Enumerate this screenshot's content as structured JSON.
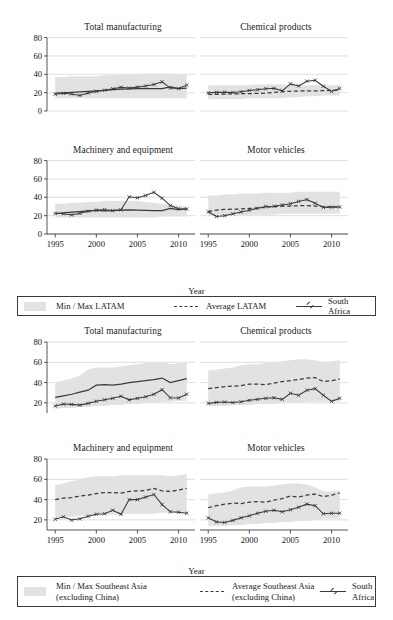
{
  "figures": [
    {
      "id": "latam",
      "axis_label_x": "Year",
      "legend": {
        "band_label": "Min / Max LATAM",
        "avg_label": "Average LATAM",
        "sa_label": "South Africa"
      },
      "panels": [
        {
          "title": "Total manufacturing"
        },
        {
          "title": "Chemical products"
        },
        {
          "title": "Machinery and equipment"
        },
        {
          "title": "Motor vehicles"
        }
      ]
    },
    {
      "id": "seasia",
      "axis_label_x": "Year",
      "legend": {
        "band_label": "Min / Max Southeast Asia\n(excluding China)",
        "avg_label": "Average Southeast Asia\n(excluding China)",
        "sa_label": "South Africa"
      },
      "panels": [
        {
          "title": "Total manufacturing"
        },
        {
          "title": "Chemical products"
        },
        {
          "title": "Machinery and equipment"
        },
        {
          "title": "Motor vehicles"
        }
      ]
    }
  ],
  "chart_data": [
    {
      "type": "line",
      "title": "Total manufacturing",
      "figure": "LATAM",
      "xlabel": "Year",
      "ylabel": "",
      "xlim": [
        1994,
        2012
      ],
      "ylim": [
        0,
        85
      ],
      "yticks": [
        0,
        20,
        40,
        60,
        80
      ],
      "xticks": [
        1995,
        2000,
        2005,
        2010
      ],
      "grid": true,
      "legend_position": "below-figure",
      "x": [
        1995,
        1996,
        1997,
        1998,
        1999,
        2000,
        2001,
        2002,
        2003,
        2004,
        2005,
        2006,
        2007,
        2008,
        2009,
        2010,
        2011
      ],
      "band_min": [
        14,
        14,
        14,
        14,
        14,
        14,
        14,
        14,
        14,
        14,
        14,
        14,
        14,
        14,
        14,
        14,
        14
      ],
      "band_max": [
        37,
        37,
        38,
        38,
        38,
        38,
        39,
        39,
        40,
        40,
        40,
        41,
        41,
        41,
        41,
        40,
        40
      ],
      "series": [
        {
          "name": "Average LATAM",
          "style": "solid",
          "values": [
            19.5,
            19.8,
            20.2,
            20.8,
            21.4,
            22.0,
            22.6,
            23.2,
            23.8,
            24.2,
            24.3,
            24.3,
            24.4,
            24.5,
            26.3,
            24.5,
            24.8
          ]
        },
        {
          "name": "South Africa",
          "style": "marker-line",
          "values": [
            18.3,
            19.3,
            18.6,
            17.0,
            19.6,
            21.3,
            22.6,
            24.2,
            25.8,
            25.0,
            26.0,
            27.2,
            28.9,
            31.8,
            25.0,
            24.5,
            28.2
          ]
        }
      ]
    },
    {
      "type": "line",
      "title": "Chemical products",
      "figure": "LATAM",
      "xlabel": "Year",
      "ylabel": "",
      "xlim": [
        1994,
        2012
      ],
      "ylim": [
        0,
        85
      ],
      "yticks": [
        0,
        20,
        40,
        60,
        80
      ],
      "xticks": [
        1995,
        2000,
        2005,
        2010
      ],
      "grid": true,
      "x": [
        1995,
        1996,
        1997,
        1998,
        1999,
        2000,
        2001,
        2002,
        2003,
        2004,
        2005,
        2006,
        2007,
        2008,
        2009,
        2010,
        2011
      ],
      "band_min": [
        13,
        13,
        13,
        13,
        13,
        14,
        14,
        14,
        14,
        14,
        15,
        15,
        16,
        16,
        17,
        17,
        17
      ],
      "band_max": [
        28,
        28,
        28,
        28,
        28,
        28,
        29,
        29,
        29,
        29,
        28,
        28,
        28,
        28,
        28,
        28,
        28
      ],
      "series": [
        {
          "name": "Average LATAM",
          "style": "dashed",
          "values": [
            18.0,
            18.2,
            18.5,
            18.6,
            18.8,
            19.0,
            19.2,
            19.5,
            20.3,
            21.0,
            21.5,
            21.8,
            22.0,
            22.0,
            22.2,
            22.4,
            23.0
          ]
        },
        {
          "name": "South Africa",
          "style": "marker-line",
          "values": [
            19.8,
            20.3,
            20.5,
            20.2,
            21.0,
            22.4,
            23.2,
            24.3,
            24.7,
            22.0,
            29.5,
            27.3,
            32.5,
            33.5,
            27.0,
            21.3,
            24.5
          ]
        }
      ]
    },
    {
      "type": "line",
      "title": "Machinery and equipment",
      "figure": "LATAM",
      "xlabel": "Year",
      "ylabel": "",
      "xlim": [
        1994,
        2012
      ],
      "ylim": [
        0,
        85
      ],
      "yticks": [
        0,
        20,
        40,
        60,
        80
      ],
      "xticks": [
        1995,
        2000,
        2005,
        2010
      ],
      "grid": true,
      "x": [
        1995,
        1996,
        1997,
        1998,
        1999,
        2000,
        2001,
        2002,
        2003,
        2004,
        2005,
        2006,
        2007,
        2008,
        2009,
        2010,
        2011
      ],
      "band_min": [
        18,
        18,
        18,
        18,
        18,
        18,
        18,
        18,
        18,
        18,
        18,
        18,
        18,
        19,
        19,
        19,
        19
      ],
      "band_max": [
        33,
        33,
        34,
        34,
        35,
        35,
        36,
        36,
        36,
        36,
        36,
        35,
        34,
        33,
        32,
        31,
        30
      ],
      "series": [
        {
          "name": "Average LATAM",
          "style": "solid",
          "values": [
            22.3,
            23.0,
            23.8,
            24.5,
            25.2,
            25.8,
            25.3,
            25.5,
            26.0,
            26.2,
            26.0,
            25.8,
            25.6,
            25.5,
            27.8,
            26.5,
            27.3
          ]
        },
        {
          "name": "South Africa",
          "style": "marker-line",
          "values": [
            22.5,
            22.0,
            20.8,
            22.5,
            24.8,
            26.0,
            26.5,
            25.5,
            26.3,
            40.5,
            39.5,
            42.0,
            45.5,
            39.0,
            31.0,
            27.5,
            27.3
          ]
        }
      ]
    },
    {
      "type": "line",
      "title": "Motor vehicles",
      "figure": "LATAM",
      "xlabel": "Year",
      "ylabel": "",
      "xlim": [
        1994,
        2012
      ],
      "ylim": [
        0,
        85
      ],
      "yticks": [
        0,
        20,
        40,
        60,
        80
      ],
      "xticks": [
        1995,
        2000,
        2005,
        2010
      ],
      "grid": true,
      "x": [
        1995,
        1996,
        1997,
        1998,
        1999,
        2000,
        2001,
        2002,
        2003,
        2004,
        2005,
        2006,
        2007,
        2008,
        2009,
        2010,
        2011
      ],
      "band_min": [
        20,
        20,
        20,
        20,
        20,
        21,
        21,
        21,
        21,
        22,
        22,
        22,
        22,
        22,
        22,
        22,
        22
      ],
      "band_max": [
        42,
        42,
        43,
        43,
        44,
        44,
        44,
        45,
        45,
        45,
        45,
        46,
        46,
        46,
        46,
        46,
        46
      ],
      "series": [
        {
          "name": "Average LATAM",
          "style": "dashed",
          "values": [
            24.5,
            26.0,
            26.8,
            27.0,
            27.3,
            27.8,
            28.3,
            29.0,
            29.8,
            30.3,
            30.5,
            30.8,
            31.0,
            30.5,
            29.8,
            29.5,
            29.5
          ]
        },
        {
          "name": "South Africa",
          "style": "marker-line",
          "values": [
            24.3,
            19.0,
            20.0,
            22.0,
            24.0,
            26.0,
            28.0,
            30.0,
            30.3,
            31.5,
            33.0,
            35.5,
            37.5,
            33.5,
            29.0,
            29.3,
            29.5
          ]
        }
      ]
    },
    {
      "type": "line",
      "title": "Total manufacturing",
      "figure": "Southeast Asia (excluding China)",
      "xlabel": "Year",
      "ylabel": "",
      "xlim": [
        1994,
        2012
      ],
      "ylim": [
        10,
        85
      ],
      "yticks": [
        20,
        40,
        60,
        80
      ],
      "xticks": [
        1995,
        2000,
        2005,
        2010
      ],
      "grid": true,
      "x": [
        1995,
        1996,
        1997,
        1998,
        1999,
        2000,
        2001,
        2002,
        2003,
        2004,
        2005,
        2006,
        2007,
        2008,
        2009,
        2010,
        2011
      ],
      "band_min": [
        14,
        15,
        15,
        16,
        16,
        17,
        17,
        18,
        18,
        19,
        19,
        20,
        20,
        21,
        21,
        22,
        22
      ],
      "band_max": [
        40,
        42,
        44,
        47,
        53,
        55,
        55,
        55,
        56,
        57,
        58,
        59,
        60,
        60,
        58,
        59,
        60
      ],
      "series": [
        {
          "name": "Average Southeast Asia (excluding China)",
          "style": "solid",
          "values": [
            25.5,
            27.0,
            28.5,
            30.5,
            32.5,
            37.5,
            38.0,
            37.5,
            38.5,
            40.0,
            41.0,
            42.0,
            43.0,
            44.5,
            40.0,
            42.0,
            44.0
          ]
        },
        {
          "name": "South Africa",
          "style": "marker-line",
          "values": [
            17.0,
            18.8,
            18.5,
            17.8,
            19.5,
            21.5,
            23.0,
            24.5,
            26.5,
            23.0,
            24.5,
            26.0,
            28.5,
            33.0,
            25.0,
            24.8,
            28.5
          ]
        }
      ]
    },
    {
      "type": "line",
      "title": "Chemical products",
      "figure": "Southeast Asia (excluding China)",
      "xlabel": "Year",
      "ylabel": "",
      "xlim": [
        1994,
        2012
      ],
      "ylim": [
        10,
        85
      ],
      "yticks": [
        20,
        40,
        60,
        80
      ],
      "xticks": [
        1995,
        2000,
        2005,
        2010
      ],
      "grid": true,
      "x": [
        1995,
        1996,
        1997,
        1998,
        1999,
        2000,
        2001,
        2002,
        2003,
        2004,
        2005,
        2006,
        2007,
        2008,
        2009,
        2010,
        2011
      ],
      "band_min": [
        17,
        17,
        17,
        18,
        18,
        18,
        19,
        19,
        19,
        20,
        20,
        20,
        21,
        21,
        21,
        21,
        21
      ],
      "band_max": [
        52,
        53,
        54,
        55,
        57,
        58,
        58,
        59,
        60,
        61,
        62,
        63,
        63,
        62,
        60,
        61,
        62
      ],
      "series": [
        {
          "name": "Average Southeast Asia (excluding China)",
          "style": "dashed",
          "values": [
            34.0,
            35.0,
            36.0,
            36.5,
            37.0,
            38.5,
            38.5,
            38.0,
            39.5,
            41.0,
            42.0,
            43.0,
            44.5,
            45.0,
            41.0,
            42.0,
            43.5
          ]
        },
        {
          "name": "South Africa",
          "style": "marker-line",
          "values": [
            19.5,
            20.5,
            20.8,
            20.3,
            21.0,
            22.5,
            23.5,
            24.5,
            25.0,
            23.5,
            29.5,
            27.5,
            32.5,
            34.0,
            27.5,
            21.5,
            24.5
          ]
        }
      ]
    },
    {
      "type": "line",
      "title": "Machinery and equipment",
      "figure": "Southeast Asia (excluding China)",
      "xlabel": "Year",
      "ylabel": "",
      "xlim": [
        1994,
        2012
      ],
      "ylim": [
        10,
        85
      ],
      "yticks": [
        20,
        40,
        60,
        80
      ],
      "xticks": [
        1995,
        2000,
        2005,
        2010
      ],
      "grid": true,
      "x": [
        1995,
        1996,
        1997,
        1998,
        1999,
        2000,
        2001,
        2002,
        2003,
        2004,
        2005,
        2006,
        2007,
        2008,
        2009,
        2010,
        2011
      ],
      "band_min": [
        22,
        23,
        23,
        24,
        24,
        25,
        25,
        25,
        25,
        26,
        26,
        26,
        26,
        27,
        27,
        27,
        27
      ],
      "band_max": [
        54,
        56,
        58,
        60,
        62,
        63,
        63,
        63,
        64,
        64,
        64,
        64,
        64,
        64,
        63,
        64,
        65
      ],
      "series": [
        {
          "name": "Average Southeast Asia (excluding China)",
          "style": "dashed",
          "values": [
            40.0,
            41.5,
            42.0,
            43.5,
            44.5,
            46.0,
            47.0,
            47.0,
            46.5,
            48.0,
            48.5,
            49.0,
            51.0,
            48.5,
            48.0,
            49.5,
            51.0
          ]
        },
        {
          "name": "South Africa",
          "style": "marker-line",
          "values": [
            20.5,
            23.0,
            19.8,
            21.0,
            23.5,
            25.5,
            26.0,
            29.5,
            25.5,
            40.0,
            40.0,
            42.5,
            45.0,
            35.0,
            28.0,
            27.5,
            26.5
          ]
        }
      ]
    },
    {
      "type": "line",
      "title": "Motor vehicles",
      "figure": "Southeast Asia (excluding China)",
      "xlabel": "Year",
      "ylabel": "",
      "xlim": [
        1994,
        2012
      ],
      "ylim": [
        10,
        85
      ],
      "yticks": [
        20,
        40,
        60,
        80
      ],
      "xticks": [
        1995,
        2000,
        2005,
        2010
      ],
      "grid": true,
      "x": [
        1995,
        1996,
        1997,
        1998,
        1999,
        2000,
        2001,
        2002,
        2003,
        2004,
        2005,
        2006,
        2007,
        2008,
        2009,
        2010,
        2011
      ],
      "band_min": [
        14,
        14,
        14,
        15,
        15,
        16,
        16,
        17,
        17,
        18,
        18,
        19,
        19,
        20,
        21,
        21,
        21
      ],
      "band_max": [
        45,
        46,
        47,
        49,
        52,
        53,
        53,
        53,
        54,
        55,
        56,
        56,
        55,
        52,
        48,
        48,
        49
      ],
      "series": [
        {
          "name": "Average Southeast Asia (excluding China)",
          "style": "dashed",
          "values": [
            32.0,
            34.0,
            35.5,
            36.5,
            36.0,
            37.5,
            38.0,
            37.5,
            39.5,
            41.0,
            43.5,
            42.5,
            44.5,
            45.5,
            43.0,
            44.5,
            46.5
          ]
        },
        {
          "name": "South Africa",
          "style": "marker-line",
          "values": [
            22.0,
            18.0,
            17.5,
            19.5,
            22.0,
            24.0,
            26.5,
            28.5,
            29.5,
            28.0,
            30.0,
            32.5,
            35.5,
            34.0,
            26.0,
            26.5,
            26.5
          ]
        }
      ]
    }
  ]
}
